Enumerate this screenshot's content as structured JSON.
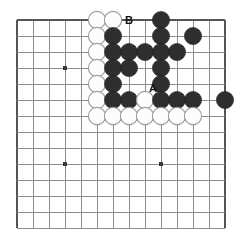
{
  "diagram": {
    "kind": "go-board-problem",
    "board": {
      "columns": 14,
      "rows": 14,
      "origin_x": 17,
      "origin_y": 20,
      "spacing": 16,
      "stone_radius": 8.6,
      "line_color": "#8c8c8c",
      "edge_color": "#555555",
      "background_color": "#ffffff"
    },
    "star_points": [
      {
        "col": 3,
        "row": 3
      },
      {
        "col": 3,
        "row": 9
      },
      {
        "col": 9,
        "row": 9
      },
      {
        "col": 9,
        "row": 3
      }
    ],
    "stones": [
      {
        "color": "white",
        "col": 5,
        "row": 0
      },
      {
        "color": "white",
        "col": 6,
        "row": 0
      },
      {
        "color": "black",
        "col": 9,
        "row": 0
      },
      {
        "color": "white",
        "col": 5,
        "row": 1
      },
      {
        "color": "black",
        "col": 6,
        "row": 1
      },
      {
        "color": "black",
        "col": 9,
        "row": 1
      },
      {
        "color": "black",
        "col": 11,
        "row": 1
      },
      {
        "color": "white",
        "col": 5,
        "row": 2
      },
      {
        "color": "black",
        "col": 6,
        "row": 2
      },
      {
        "color": "black",
        "col": 7,
        "row": 2
      },
      {
        "color": "black",
        "col": 8,
        "row": 2
      },
      {
        "color": "black",
        "col": 9,
        "row": 2
      },
      {
        "color": "black",
        "col": 10,
        "row": 2
      },
      {
        "color": "white",
        "col": 5,
        "row": 3
      },
      {
        "color": "black",
        "col": 6,
        "row": 3
      },
      {
        "color": "black",
        "col": 7,
        "row": 3
      },
      {
        "color": "black",
        "col": 9,
        "row": 3
      },
      {
        "color": "white",
        "col": 5,
        "row": 4
      },
      {
        "color": "black",
        "col": 6,
        "row": 4
      },
      {
        "color": "black",
        "col": 9,
        "row": 4
      },
      {
        "color": "white",
        "col": 5,
        "row": 5
      },
      {
        "color": "black",
        "col": 6,
        "row": 5
      },
      {
        "color": "black",
        "col": 7,
        "row": 5
      },
      {
        "color": "white",
        "col": 8,
        "row": 5
      },
      {
        "color": "black",
        "col": 9,
        "row": 5
      },
      {
        "color": "black",
        "col": 10,
        "row": 5
      },
      {
        "color": "black",
        "col": 11,
        "row": 5
      },
      {
        "color": "black",
        "col": 13,
        "row": 5
      },
      {
        "color": "white",
        "col": 5,
        "row": 6
      },
      {
        "color": "white",
        "col": 6,
        "row": 6
      },
      {
        "color": "white",
        "col": 7,
        "row": 6
      },
      {
        "color": "white",
        "col": 8,
        "row": 6
      },
      {
        "color": "white",
        "col": 9,
        "row": 6
      },
      {
        "color": "white",
        "col": 10,
        "row": 6
      },
      {
        "color": "white",
        "col": 11,
        "row": 6
      }
    ],
    "markers": [
      {
        "label": "B",
        "col": 7.0,
        "row": 0.0
      },
      {
        "label": "A",
        "col": 8.5,
        "row": 4.25
      }
    ]
  }
}
